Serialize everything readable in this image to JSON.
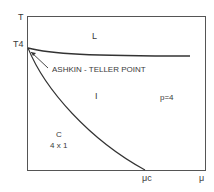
{
  "diagram": {
    "axes": {
      "y_label": "T",
      "x_label": "μ",
      "y_tick": "T4",
      "x_tick": "μc"
    },
    "regions": {
      "liquid": "L",
      "incommensurate": "I",
      "commensurate_line1": "C",
      "commensurate_line2": "4 x 1",
      "p_value": "p=4"
    },
    "annotation": "ASHKIN - TELLER POINT"
  }
}
